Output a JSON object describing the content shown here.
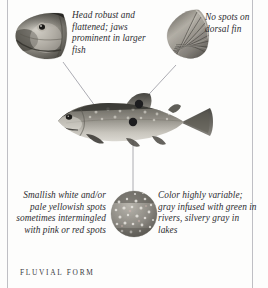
{
  "figure": {
    "caption": "FLUVIAL FORM",
    "rendering": "grayscale photographic illustration"
  },
  "annotations": [
    {
      "id": "head",
      "text": "Head robust and flattened; jaws prominent in larger fish",
      "lines": [
        "Head robust",
        "and flattened;",
        "jaws prominent",
        "in larger fish"
      ],
      "points_to": "fish-head"
    },
    {
      "id": "dorsal-fin",
      "text": "No spots on dorsal fin",
      "lines": [
        "No spots",
        "on",
        "dorsal fin"
      ],
      "points_to": "fish-dorsal-fin"
    },
    {
      "id": "spots",
      "text": "Smallish white and/or pale yellowish spots sometimes intermingled with pink or red spots",
      "lines": [
        "Smallish white",
        "and/or pale yellowish",
        "spots sometimes",
        "intermingled with",
        "pink or red spots"
      ],
      "points_to": "fish-flank"
    },
    {
      "id": "color",
      "text": "Color highly variable; gray infused with green in rivers, silvery gray in lakes",
      "lines": [
        "Color highly",
        "variable; gray",
        "infused with green",
        "in rivers, silvery gray",
        "in lakes"
      ],
      "points_to": "fish-flank"
    }
  ],
  "insets": {
    "head": {
      "label": "head detail inset",
      "shape": "irregular crop"
    },
    "dorsal_fin": {
      "label": "dorsal fin detail inset",
      "shape": "irregular crop"
    },
    "skin": {
      "label": "flank spotting detail inset",
      "shape": "circle"
    }
  },
  "colors": {
    "page_background": "#fdfdfc",
    "margin_rule": "#bfbfc4",
    "leader_line": "#8e8e94",
    "text": "#2c2c30",
    "caption_text": "#3a3a3e",
    "fish_back": "#575köp",
    "fish_back_hex": "#56554e",
    "fish_belly": "#e9e7e2",
    "marker_dot": "#1d1d1f"
  }
}
